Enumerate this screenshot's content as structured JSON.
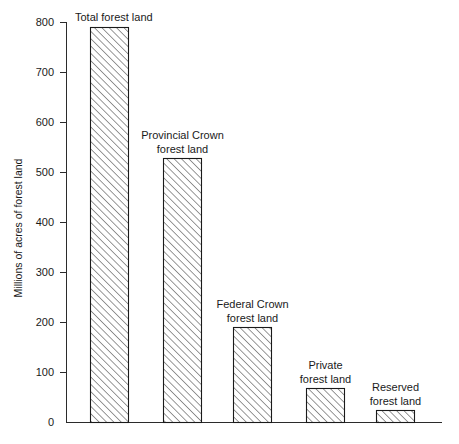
{
  "chart_data": {
    "type": "bar",
    "title": "",
    "subtitle": "",
    "xlabel": "",
    "ylabel": "Millions of acres of forest land",
    "ylim": [
      0,
      800
    ],
    "ytick_interval": 100,
    "yticks": [
      "0",
      "100",
      "200",
      "300",
      "400",
      "500",
      "600",
      "700",
      "800"
    ],
    "xticks": [],
    "grid": false,
    "legend": false,
    "legend_position": "none",
    "categories": [
      "Total forest land",
      "Provincial Crown forest land",
      "Federal Crown forest land",
      "Private forest land",
      "Reserved forest land"
    ],
    "values": [
      790,
      528,
      190,
      68,
      24
    ],
    "bar_fill": "hatched-diagonal",
    "bar_color": "#ffffff",
    "bar_edge_color": "#1a1a1a",
    "hatch_color": "#1a1a1a",
    "annotations": [
      {
        "text_lines": [
          "Total forest land"
        ],
        "value": 790
      },
      {
        "text_lines": [
          "Provincial Crown",
          "forest land"
        ],
        "value": 528
      },
      {
        "text_lines": [
          "Federal Crown",
          "forest land"
        ],
        "value": 190
      },
      {
        "text_lines": [
          "Private",
          "forest land"
        ],
        "value": 68
      },
      {
        "text_lines": [
          "Reserved",
          "forest land"
        ],
        "value": 24
      }
    ]
  },
  "axis": {
    "y_title": "Millions of acres of forest land",
    "tick_800": "800",
    "tick_700": "700",
    "tick_600": "600",
    "tick_500": "500",
    "tick_400": "400",
    "tick_300": "300",
    "tick_200": "200",
    "tick_100": "100",
    "tick_0": "0"
  },
  "labels": {
    "bar1_line1": "Total forest land",
    "bar2_line1": "Provincial Crown",
    "bar2_line2": "forest land",
    "bar3_line1": "Federal Crown",
    "bar3_line2": "forest land",
    "bar4_line1": "Private",
    "bar4_line2": "forest land",
    "bar5_line1": "Reserved",
    "bar5_line2": "forest land"
  }
}
